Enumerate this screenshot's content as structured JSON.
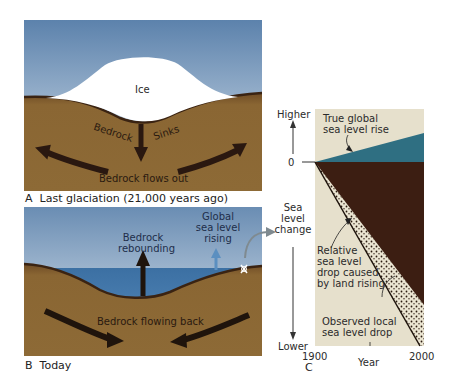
{
  "panel_a": {
    "caption_letter": "A",
    "caption": "Last glaciation (21,000 years ago)",
    "labels": {
      "ice": "Ice",
      "bedrock": "Bedrock",
      "sinks": "Sinks",
      "flows_out": "Bedrock flows out"
    }
  },
  "panel_b": {
    "caption_letter": "B",
    "caption": "Today",
    "labels": {
      "rebounding_line1": "Bedrock",
      "rebounding_line2": "rebounding",
      "global_line1": "Global",
      "global_line2": "sea level",
      "global_line3": "rising",
      "flowing_back": "Bedrock flowing back"
    }
  },
  "panel_c": {
    "caption_letter": "C",
    "axis": {
      "higher": "Higher",
      "zero": "0",
      "ylabel_line1": "Sea",
      "ylabel_line2": "level",
      "ylabel_line3": "change",
      "lower": "Lower",
      "x_start": "1900",
      "x_end": "2000",
      "xlabel": "Year"
    },
    "annotations": {
      "true_rise_line1": "True global",
      "true_rise_line2": "sea level rise",
      "relative_line1": "Relative",
      "relative_line2": "sea level",
      "relative_line3": "drop caused",
      "relative_line4": "by land rising",
      "observed_line1": "Observed local",
      "observed_line2": "sea level drop"
    }
  },
  "colors": {
    "sky_top": "#5f84ad",
    "sky_bottom": "#dfe8f0",
    "bedrock": "#8a6633",
    "bedrock_dark": "#3b2412",
    "water": "#3f74a6",
    "ice": "#ffffff",
    "chart_bg": "#e6e0cc",
    "teal": "#2f6f82",
    "chart_brown": "#3c1e12"
  }
}
